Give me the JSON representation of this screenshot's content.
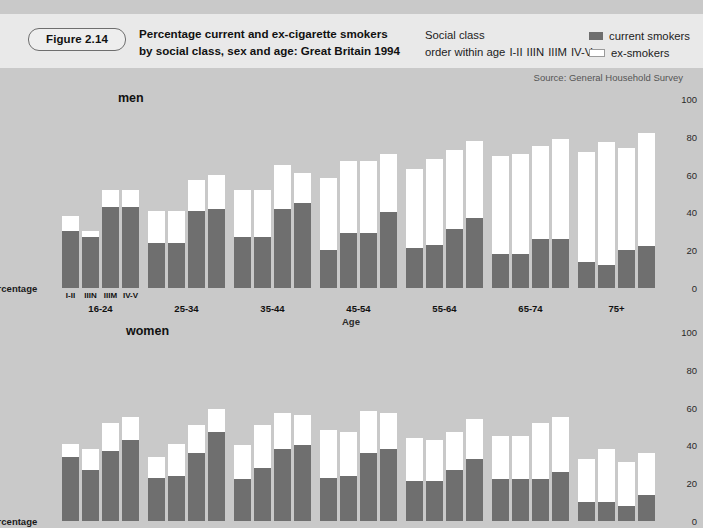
{
  "figure": {
    "badge": "Figure 2.14",
    "title_line1": "Percentage current and ex-cigarette smokers",
    "title_line2": "by social class, sex and age: Great Britain 1994",
    "source": "Source: General Household Survey"
  },
  "note": {
    "line1": "Social class",
    "line2_prefix": "order within age",
    "classes": [
      "I-II",
      "IIIN",
      "IIIM",
      "IV-V"
    ]
  },
  "legend": {
    "items": [
      {
        "label": "current smokers",
        "color": "#6e6e6e",
        "key": "current"
      },
      {
        "label": "ex-smokers",
        "color": "#ffffff",
        "key": "ex"
      }
    ]
  },
  "axis": {
    "y_caption": "Percentage",
    "x_caption": "Age",
    "y_ticks": [
      0,
      20,
      40,
      60,
      80,
      100
    ],
    "ylim": [
      0,
      100
    ]
  },
  "panels": [
    {
      "key": "men",
      "title": "men"
    },
    {
      "key": "women",
      "title": "women"
    }
  ],
  "chart_data": {
    "type": "bar",
    "title": "Percentage current and ex-cigarette smokers by social class, sex and age: Great Britain 1994",
    "subtitle": "Social class order within age I-II IIIN IIIM IV-V",
    "xlabel": "Age",
    "ylabel": "Percentage",
    "ylim": [
      0,
      100
    ],
    "yticks": [
      0,
      20,
      40,
      60,
      80,
      100
    ],
    "grid": false,
    "legend": [
      "current smokers",
      "ex-smokers"
    ],
    "legend_position": "top-right",
    "stacked": true,
    "social_classes": [
      "I-II",
      "IIIN",
      "IIIM",
      "IV-V"
    ],
    "age_groups": [
      "16-24",
      "25-34",
      "35-44",
      "45-54",
      "55-64",
      "65-74",
      "75+"
    ],
    "panels": [
      {
        "name": "men",
        "groups": [
          {
            "age": "16-24",
            "bars": [
              {
                "class": "I-II",
                "current": 30,
                "total": 38
              },
              {
                "class": "IIIN",
                "current": 27,
                "total": 30
              },
              {
                "class": "IIIM",
                "current": 43,
                "total": 52
              },
              {
                "class": "IV-V",
                "current": 43,
                "total": 52
              }
            ]
          },
          {
            "age": "25-34",
            "bars": [
              {
                "class": "I-II",
                "current": 24,
                "total": 41
              },
              {
                "class": "IIIN",
                "current": 24,
                "total": 41
              },
              {
                "class": "IIIM",
                "current": 41,
                "total": 57
              },
              {
                "class": "IV-V",
                "current": 42,
                "total": 60
              }
            ]
          },
          {
            "age": "35-44",
            "bars": [
              {
                "class": "I-II",
                "current": 27,
                "total": 52
              },
              {
                "class": "IIIN",
                "current": 27,
                "total": 52
              },
              {
                "class": "IIIM",
                "current": 42,
                "total": 65
              },
              {
                "class": "IV-V",
                "current": 45,
                "total": 61
              }
            ]
          },
          {
            "age": "45-54",
            "bars": [
              {
                "class": "I-II",
                "current": 20,
                "total": 58
              },
              {
                "class": "IIIN",
                "current": 29,
                "total": 67
              },
              {
                "class": "IIIM",
                "current": 29,
                "total": 67
              },
              {
                "class": "IV-V",
                "current": 40,
                "total": 71
              }
            ]
          },
          {
            "age": "55-64",
            "bars": [
              {
                "class": "I-II",
                "current": 21,
                "total": 63
              },
              {
                "class": "IIIN",
                "current": 23,
                "total": 68
              },
              {
                "class": "IIIM",
                "current": 31,
                "total": 73
              },
              {
                "class": "IV-V",
                "current": 37,
                "total": 78
              }
            ]
          },
          {
            "age": "65-74",
            "bars": [
              {
                "class": "I-II",
                "current": 18,
                "total": 70
              },
              {
                "class": "IIIN",
                "current": 18,
                "total": 71
              },
              {
                "class": "IIIM",
                "current": 26,
                "total": 75
              },
              {
                "class": "IV-V",
                "current": 26,
                "total": 79
              }
            ]
          },
          {
            "age": "75+",
            "bars": [
              {
                "class": "I-II",
                "current": 14,
                "total": 72
              },
              {
                "class": "IIIN",
                "current": 12,
                "total": 77
              },
              {
                "class": "IIIM",
                "current": 20,
                "total": 74
              },
              {
                "class": "IV-V",
                "current": 22,
                "total": 82
              }
            ]
          }
        ]
      },
      {
        "name": "women",
        "groups": [
          {
            "age": "16-24",
            "bars": [
              {
                "class": "I-II",
                "current": 34,
                "total": 41
              },
              {
                "class": "IIIN",
                "current": 27,
                "total": 38
              },
              {
                "class": "IIIM",
                "current": 37,
                "total": 52
              },
              {
                "class": "IV-V",
                "current": 43,
                "total": 55
              }
            ]
          },
          {
            "age": "25-34",
            "bars": [
              {
                "class": "I-II",
                "current": 23,
                "total": 34
              },
              {
                "class": "IIIN",
                "current": 24,
                "total": 41
              },
              {
                "class": "IIIM",
                "current": 36,
                "total": 51
              },
              {
                "class": "IV-V",
                "current": 47,
                "total": 59
              }
            ]
          },
          {
            "age": "35-44",
            "bars": [
              {
                "class": "I-II",
                "current": 22,
                "total": 40
              },
              {
                "class": "IIIN",
                "current": 28,
                "total": 51
              },
              {
                "class": "IIIM",
                "current": 38,
                "total": 57
              },
              {
                "class": "IV-V",
                "current": 40,
                "total": 56
              }
            ]
          },
          {
            "age": "45-54",
            "bars": [
              {
                "class": "I-II",
                "current": 23,
                "total": 48
              },
              {
                "class": "IIIN",
                "current": 24,
                "total": 47
              },
              {
                "class": "IIIM",
                "current": 36,
                "total": 58
              },
              {
                "class": "IV-V",
                "current": 38,
                "total": 57
              }
            ]
          },
          {
            "age": "55-64",
            "bars": [
              {
                "class": "I-II",
                "current": 21,
                "total": 44
              },
              {
                "class": "IIIN",
                "current": 21,
                "total": 43
              },
              {
                "class": "IIIM",
                "current": 27,
                "total": 47
              },
              {
                "class": "IV-V",
                "current": 33,
                "total": 54
              }
            ]
          },
          {
            "age": "65-74",
            "bars": [
              {
                "class": "I-II",
                "current": 22,
                "total": 45
              },
              {
                "class": "IIIN",
                "current": 22,
                "total": 45
              },
              {
                "class": "IIIM",
                "current": 22,
                "total": 52
              },
              {
                "class": "IV-V",
                "current": 26,
                "total": 55
              }
            ]
          },
          {
            "age": "75+",
            "bars": [
              {
                "class": "I-II",
                "current": 10,
                "total": 33
              },
              {
                "class": "IIIN",
                "current": 10,
                "total": 38
              },
              {
                "class": "IIIM",
                "current": 8,
                "total": 31
              },
              {
                "class": "IV-V",
                "current": 14,
                "total": 36
              }
            ]
          }
        ]
      }
    ]
  }
}
